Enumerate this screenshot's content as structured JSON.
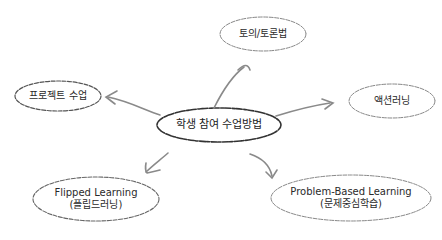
{
  "diagram": {
    "center": {
      "label": "학생 참여 수업방법"
    },
    "nodes": [
      {
        "id": "debate",
        "label": "토의/토론법",
        "sub": ""
      },
      {
        "id": "action",
        "label": "액션러닝",
        "sub": ""
      },
      {
        "id": "pbl",
        "label": "Problem-Based Learning",
        "sub": "(문제중심학습)"
      },
      {
        "id": "flipped",
        "label": "Flipped Learning",
        "sub": "(플립드러닝)"
      },
      {
        "id": "project",
        "label": "프로젝트 수업",
        "sub": ""
      }
    ],
    "colors": {
      "stroke": "#555555",
      "arrow": "#8a8a8a",
      "text": "#2a2a2a"
    }
  }
}
